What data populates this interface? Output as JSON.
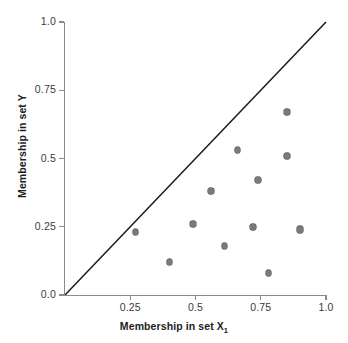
{
  "figure": {
    "background_color": "#ffffff",
    "axis_color": "#8a8a8a",
    "marker_color": "#7b7b7b",
    "marker_edge_color": "#606060",
    "line_color": "#1a1a1a"
  },
  "axes": {
    "x_title_main": "Membership in set X",
    "x_title_sub": "1",
    "y_title": "Membership in set Y",
    "x_ticklabels": [
      "0.25",
      "0.5",
      "0.75",
      "1.0"
    ],
    "x_tickvalues": [
      0.25,
      0.5,
      0.75,
      1.0
    ],
    "y_ticklabels": [
      "1.0",
      "0.75",
      "0.5",
      "0.25",
      "0.0"
    ],
    "y_tickvalues": [
      1.0,
      0.75,
      0.5,
      0.25,
      0.0
    ]
  },
  "chart_data": {
    "type": "scatter",
    "title": "",
    "xlabel": "Membership in set X1",
    "ylabel": "Membership in set Y",
    "xlim": [
      0.0,
      1.0
    ],
    "ylim": [
      0.0,
      1.0
    ],
    "xticks": [
      0.0,
      0.25,
      0.5,
      0.75,
      1.0
    ],
    "yticks": [
      0.0,
      0.25,
      0.5,
      0.75,
      1.0
    ],
    "grid": false,
    "legend": null,
    "annotations": [
      {
        "kind": "reference-line",
        "label": "y = x diagonal",
        "from": [
          0.0,
          0.0
        ],
        "to": [
          1.0,
          1.0
        ]
      }
    ],
    "series": [
      {
        "name": "cases",
        "marker": "filled-circle",
        "color": "#7b7b7b",
        "n_points": 12,
        "points": [
          {
            "x": 0.27,
            "y": 0.23
          },
          {
            "x": 0.4,
            "y": 0.12
          },
          {
            "x": 0.49,
            "y": 0.26
          },
          {
            "x": 0.56,
            "y": 0.38
          },
          {
            "x": 0.61,
            "y": 0.18
          },
          {
            "x": 0.66,
            "y": 0.53
          },
          {
            "x": 0.72,
            "y": 0.25
          },
          {
            "x": 0.74,
            "y": 0.42
          },
          {
            "x": 0.78,
            "y": 0.08
          },
          {
            "x": 0.85,
            "y": 0.67
          },
          {
            "x": 0.85,
            "y": 0.51
          },
          {
            "x": 0.9,
            "y": 0.24
          }
        ]
      }
    ]
  }
}
